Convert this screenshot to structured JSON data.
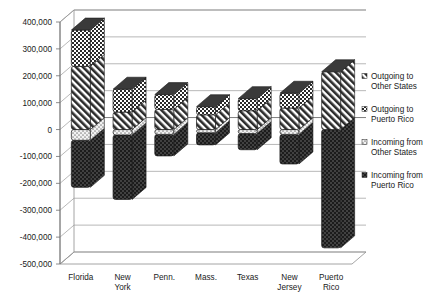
{
  "chart_data": {
    "type": "bar",
    "subtype": "stacked-column-3d",
    "title": "",
    "xlabel": "",
    "ylabel": "",
    "ylim": [
      -500000,
      400000
    ],
    "ytick_step": 100000,
    "grid": true,
    "legend_position": "right",
    "ytick_labels": [
      "400,000",
      "300,000",
      "200,000",
      "100,000",
      "0",
      "-100,000",
      "-200,000",
      "-300,000",
      "-400,000",
      "-500,000"
    ],
    "ytick_values": [
      400000,
      300000,
      200000,
      100000,
      0,
      -100000,
      -200000,
      -300000,
      -400000,
      -500000
    ],
    "categories": [
      "Florida",
      "New York",
      "Penn.",
      "Mass.",
      "Texas",
      "New Jersey",
      "Puerto Rico"
    ],
    "category_lines": [
      [
        "Florida"
      ],
      [
        "New",
        "York"
      ],
      [
        "Penn."
      ],
      [
        "Mass."
      ],
      [
        "Texas"
      ],
      [
        "New",
        "Jersey"
      ],
      [
        "Puerto",
        "Rico"
      ]
    ],
    "series": [
      {
        "name": "Outgoing to Other States",
        "pattern": "diagonal-hatch",
        "color": "#2b2b2b",
        "values": [
          235000,
          65000,
          75000,
          55000,
          70000,
          80000,
          215000
        ]
      },
      {
        "name": "Outgoing to Puerto Rico",
        "pattern": "checkerboard",
        "color": "#2b2b2b",
        "values": [
          135000,
          85000,
          55000,
          30000,
          45000,
          55000,
          0
        ]
      },
      {
        "name": "Incoming from Other States",
        "pattern": "light-dots",
        "color": "#d8d8d8",
        "values": [
          -40000,
          -20000,
          -18000,
          -12000,
          -15000,
          -18000,
          0
        ]
      },
      {
        "name": "Incoming from Puerto Rico",
        "pattern": "dark-dots",
        "color": "#1c1c1c",
        "values": [
          -175000,
          -240000,
          -80000,
          -45000,
          -60000,
          -110000,
          -440000
        ]
      }
    ],
    "legend_entries": [
      {
        "label_lines": [
          "Outgoing to",
          "Other States"
        ],
        "pattern": "diagonal-hatch"
      },
      {
        "label_lines": [
          "Outgoing to",
          "Puerto Rico"
        ],
        "pattern": "checkerboard"
      },
      {
        "label_lines": [
          "Incoming from",
          "Other States"
        ],
        "pattern": "light-dots"
      },
      {
        "label_lines": [
          "Incoming from",
          "Puerto Rico"
        ],
        "pattern": "dark-dots"
      }
    ]
  }
}
